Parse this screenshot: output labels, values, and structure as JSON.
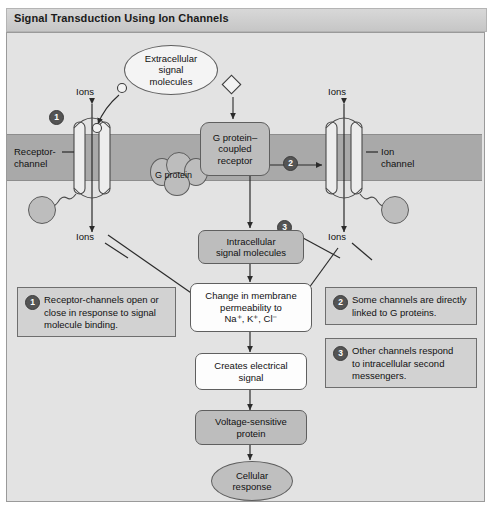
{
  "title": "Signal Transduction Using Ion Channels",
  "diagram": {
    "extracellular_bubble": "Extracellular\nsignal\nmolecules",
    "left_channel_label": "Receptor-\nchannel",
    "right_channel_label": "Ion\nchannel",
    "gpcr_label": "G protein–\ncoupled\nreceptor",
    "g_protein_label": "G protein",
    "ions_top_left": "Ions",
    "ions_bottom_left": "Ions",
    "ions_top_right": "Ions",
    "ions_bottom_right": "Ions",
    "intracellular_box": "Intracellular\nsignal molecules",
    "permeability_box": "Change in membrane\npermeability to\nNa⁺, K⁺, Cl⁻",
    "electrical_box": "Creates electrical\nsignal",
    "voltage_box": "Voltage-sensitive\nprotein",
    "response_ellipse": "Cellular\nresponse",
    "badges": {
      "one": "1",
      "two": "2",
      "three": "3"
    },
    "notes": [
      {
        "number": "1",
        "text": "Receptor-channels open or\nclose in response to signal\nmolecule binding."
      },
      {
        "number": "2",
        "text": "Some channels are directly\nlinked to G proteins."
      },
      {
        "number": "3",
        "text": "Other channels respond\nto intracellular second\nmessengers."
      }
    ]
  },
  "colors": {
    "membrane": "#a9a9a9",
    "panel_bg": "#e3e3e3",
    "box_grey": "#bdbdbd",
    "note_bg": "#d2d2d2",
    "badge": "#545454",
    "stroke": "#2b2b2b"
  }
}
